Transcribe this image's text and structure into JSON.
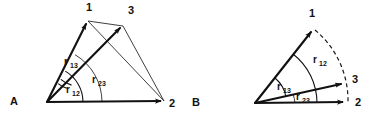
{
  "figure": {
    "background_color": "#ffffff",
    "ink_color": "#111111",
    "width": 375,
    "height": 120
  },
  "panels": [
    {
      "id": "A",
      "label": "A",
      "label_pos": {
        "x": 14,
        "y": 104
      },
      "origin": {
        "x": 47,
        "y": 102
      },
      "vertices": [
        {
          "name": "1",
          "label": "1",
          "tip": {
            "x": 88,
            "y": 21
          },
          "label_pos": {
            "x": 86,
            "y": 11
          }
        },
        {
          "name": "3",
          "label": "3",
          "tip": {
            "x": 123,
            "y": 26
          },
          "label_pos": {
            "x": 128,
            "y": 14
          }
        },
        {
          "name": "2",
          "label": "2",
          "tip": {
            "x": 164,
            "y": 101
          },
          "label_pos": {
            "x": 169,
            "y": 107
          }
        }
      ],
      "vectors": [
        {
          "from": "origin",
          "to": "1",
          "style": "thick-arrow"
        },
        {
          "from": "origin",
          "to": "3",
          "style": "thick-arrow"
        },
        {
          "from": "origin",
          "to": "2",
          "style": "thick-arrow"
        }
      ],
      "edges": [
        {
          "from": "1",
          "to": "3",
          "style": "thin"
        },
        {
          "from": "1",
          "to": "2",
          "style": "thin"
        },
        {
          "from": "3",
          "to": "2",
          "style": "thin"
        }
      ],
      "angles": [
        {
          "name": "r13",
          "base": "r",
          "sub": "13",
          "radius": 26,
          "label_pos": {
            "x": 68,
            "y": 64
          }
        },
        {
          "name": "r12",
          "base": "r",
          "sub": "12",
          "radius": 36,
          "label_pos": {
            "x": 70,
            "y": 94
          }
        },
        {
          "name": "r23",
          "base": "r",
          "sub": "23",
          "radius": 55,
          "label_pos": {
            "x": 96,
            "y": 86
          }
        }
      ]
    },
    {
      "id": "B",
      "label": "B",
      "label_pos": {
        "x": 196,
        "y": 105
      },
      "origin": {
        "x": 255,
        "y": 103
      },
      "vertices": [
        {
          "name": "1",
          "label": "1",
          "tip": {
            "x": 313,
            "y": 29
          },
          "label_pos": {
            "x": 309,
            "y": 17
          }
        },
        {
          "name": "3",
          "label": "3",
          "tip": {
            "x": 344,
            "y": 83
          },
          "label_pos": {
            "x": 352,
            "y": 82
          }
        },
        {
          "name": "2",
          "label": "2",
          "tip": {
            "x": 346,
            "y": 102
          },
          "label_pos": {
            "x": 355,
            "y": 105
          }
        }
      ],
      "vectors": [
        {
          "from": "origin",
          "to": "1",
          "style": "thick-arrow"
        },
        {
          "from": "origin",
          "to": "3",
          "style": "thick-arrow"
        },
        {
          "from": "origin",
          "to": "2",
          "style": "thick-arrow"
        }
      ],
      "dashed_arc": {
        "from": "1",
        "through": "3",
        "to": "2",
        "style": "dashed"
      },
      "angles": [
        {
          "name": "r13",
          "base": "r",
          "sub": "13",
          "radius": 32,
          "label_pos": {
            "x": 281,
            "y": 89
          }
        },
        {
          "name": "r12",
          "base": "r",
          "sub": "12",
          "radius": 62,
          "label_pos": {
            "x": 317,
            "y": 62
          }
        },
        {
          "name": "r23",
          "base": "r",
          "sub": "23",
          "radius": 40,
          "label_pos": {
            "x": 300,
            "y": 101
          }
        }
      ]
    }
  ]
}
